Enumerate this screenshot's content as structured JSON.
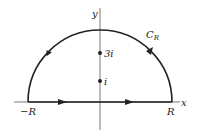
{
  "diagram": {
    "axes": {
      "x_label": "x",
      "y_label": "y"
    },
    "contour": {
      "arc_label_main": "C",
      "arc_label_sub": "R",
      "left_endpoint_label": "−R",
      "right_endpoint_label": "R"
    },
    "points": [
      {
        "label": "3i"
      },
      {
        "label": "i"
      }
    ],
    "colors": {
      "stroke": "#222222",
      "axis": "#555555",
      "background": "#ffffff"
    }
  }
}
